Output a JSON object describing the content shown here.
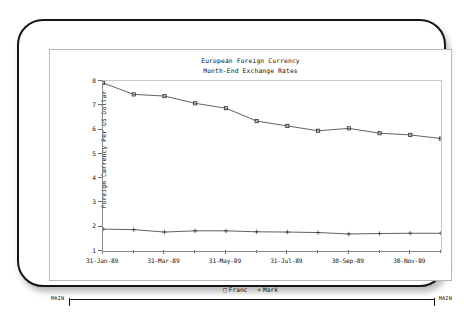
{
  "window": {
    "status_left": "MAIN",
    "status_right": "MAIN"
  },
  "chart_data": {
    "type": "line",
    "title": "European Foreign Currency",
    "subtitle": "Month-End Exchange Rates",
    "xlabel": "",
    "ylabel": "Foreign Currency Per US Dollar",
    "ylim": [
      1,
      8
    ],
    "yticks": [
      1,
      2,
      3,
      4,
      5,
      6,
      7,
      8
    ],
    "ytick_labels": [
      "1",
      "2",
      "3",
      "4",
      "5",
      "6",
      "7",
      "8"
    ],
    "x": [
      "31-Jan-89",
      "28-Feb-89",
      "31-Mar-89",
      "30-Apr-89",
      "31-May-89",
      "30-Jun-89",
      "31-Jul-89",
      "31-Aug-89",
      "30-Sep-89",
      "31-Oct-89",
      "30-Nov-89",
      "31-Dec-89"
    ],
    "xtick_labels": [
      "31-Jan-89",
      "31-Mar-89",
      "31-May-89",
      "31-Jul-89",
      "30-Sep-89",
      "30-Nov-89"
    ],
    "xtick_indices": [
      0,
      2,
      4,
      6,
      8,
      10
    ],
    "grid": false,
    "legend_position": "bottom",
    "series": [
      {
        "name": "Franc",
        "marker": "square",
        "legend_symbol": "□",
        "values": [
          7.92,
          7.45,
          7.38,
          7.08,
          6.88,
          6.35,
          6.15,
          5.95,
          6.05,
          5.85,
          5.78,
          5.63
        ]
      },
      {
        "name": "Mark",
        "marker": "plus",
        "legend_symbol": "+",
        "values": [
          1.9,
          1.88,
          1.78,
          1.83,
          1.83,
          1.79,
          1.78,
          1.76,
          1.7,
          1.72,
          1.73,
          1.73
        ]
      }
    ]
  },
  "colors": {
    "line": "#3a3a3a",
    "axis": "#8a8a8a",
    "text": "#111111",
    "bezel": "#16161a"
  }
}
